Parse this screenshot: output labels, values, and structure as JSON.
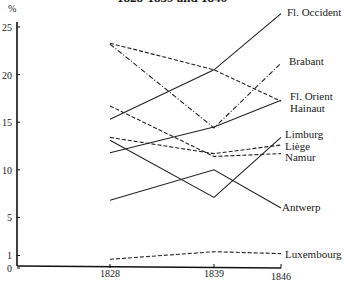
{
  "chart_data": {
    "type": "line",
    "title": "1828-1839 and 1846",
    "xlabel": "",
    "ylabel": "%",
    "x": [
      1828,
      1839,
      1846
    ],
    "ylim": [
      0,
      26
    ],
    "yticks": [
      0,
      1,
      5,
      10,
      15,
      20,
      25
    ],
    "grid": false,
    "legend_position": "inline-right",
    "series": [
      {
        "name": "Fl. Occident",
        "style": "solid",
        "values": [
          15.3,
          20.5,
          26.4
        ]
      },
      {
        "name": "Brabant",
        "style": "dashdot",
        "values": [
          23.2,
          14.4,
          21.2
        ]
      },
      {
        "name": "Fl. Orient",
        "style": "dashed",
        "values": [
          23.3,
          20.5,
          17.2
        ]
      },
      {
        "name": "Hainaut",
        "style": "solid",
        "values": [
          11.8,
          14.5,
          17.3
        ]
      },
      {
        "name": "Limburg",
        "style": "solid",
        "values": [
          13.1,
          7.1,
          13.4
        ]
      },
      {
        "name": "Liège",
        "style": "dashed",
        "values": [
          13.4,
          11.7,
          12.6
        ]
      },
      {
        "name": "Namur",
        "style": "dashed",
        "values": [
          16.7,
          11.4,
          11.7
        ]
      },
      {
        "name": "Antwerp",
        "style": "solid",
        "values": [
          6.8,
          10.0,
          6.0
        ]
      },
      {
        "name": "Luxembourg",
        "style": "dashed",
        "values": [
          0.6,
          1.4,
          1.2
        ]
      }
    ]
  }
}
